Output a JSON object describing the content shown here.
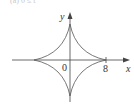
{
  "diagram": {
    "type": "astroid",
    "top_caption": "(a) 0 ≤ t",
    "axes": {
      "x_label": "x",
      "y_label": "y",
      "origin_label": "0",
      "x_tick_label": "8"
    },
    "curve": {
      "equation": "x^(2/3) + y^(2/3) = 8^(2/3)",
      "cusps": [
        [
          8,
          0
        ],
        [
          0,
          8
        ],
        [
          -8,
          0
        ],
        [
          0,
          -8
        ]
      ]
    },
    "colors": {
      "curve": "#555555",
      "axes": "#444444"
    }
  }
}
